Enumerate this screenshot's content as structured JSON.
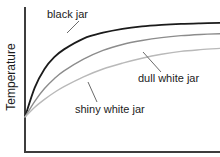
{
  "chart_data": {
    "type": "line",
    "title": "",
    "xlabel": "",
    "ylabel": "Temperature",
    "grid": false,
    "legend_position": "inline-annotations",
    "axis_style": "arrowless-two-axis",
    "xlim": [
      0,
      100
    ],
    "ylim": [
      0,
      100
    ],
    "x_tick_labels": [],
    "y_tick_labels": [],
    "series": [
      {
        "name": "black jar",
        "color": "#1b1b1b",
        "stroke_width": 1.8,
        "final_value": 96,
        "x": [
          0,
          5,
          10,
          15,
          20,
          30,
          40,
          50,
          60,
          70,
          80,
          90,
          100
        ],
        "y": [
          0,
          30,
          49,
          61,
          69,
          80,
          86,
          90,
          92.5,
          94,
          95,
          95.6,
          96
        ]
      },
      {
        "name": "dull white jar",
        "color": "#8c8c8c",
        "stroke_width": 1.4,
        "final_value": 85,
        "x": [
          0,
          5,
          10,
          15,
          20,
          30,
          40,
          50,
          60,
          70,
          80,
          90,
          100
        ],
        "y": [
          0,
          16,
          29,
          39,
          47,
          59,
          68,
          74,
          78,
          81,
          83,
          84.2,
          85
        ]
      },
      {
        "name": "shiny white jar",
        "color": "#b9b9b9",
        "stroke_width": 1.4,
        "final_value": 70,
        "x": [
          0,
          5,
          10,
          15,
          20,
          30,
          40,
          50,
          60,
          70,
          80,
          90,
          100
        ],
        "y": [
          0,
          10,
          18,
          25,
          31,
          41,
          49,
          55,
          60,
          64,
          67,
          68.7,
          70
        ]
      }
    ],
    "annotations": [
      {
        "text": "black jar",
        "text_x": 47,
        "text_y": 18,
        "leader": [
          [
            79,
            21
          ],
          [
            67,
            33
          ]
        ]
      },
      {
        "text": "dull white jar",
        "text_x": 138,
        "text_y": 82,
        "leader": [
          [
            143,
            52
          ],
          [
            161,
            72
          ]
        ]
      },
      {
        "text": "shiny white jar",
        "text_x": 75,
        "text_y": 113,
        "leader": [
          [
            88,
            82
          ],
          [
            97,
            102
          ]
        ]
      }
    ],
    "colors": {
      "axis": "#3d3d3d",
      "background": "#ffffff",
      "black_jar": "#1b1b1b",
      "dull_white_jar": "#8c8c8c",
      "shiny_white_jar": "#b9b9b9",
      "leader": "#6b6b6b",
      "text": "#1b1b1b"
    }
  }
}
